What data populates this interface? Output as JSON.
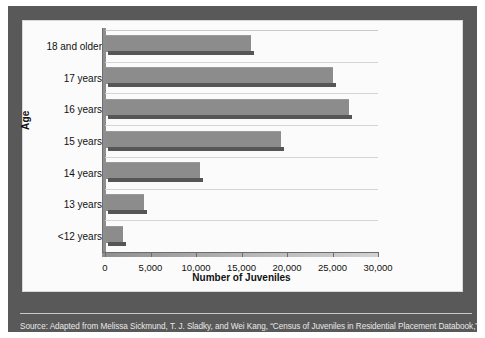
{
  "figure": {
    "source_note": "Source: Adapted from Melissa Sickmund, T. J. Sladky, and Wei Kang, “Census of Juveniles in Residential Placement Databook,”",
    "frame_color": "#595959",
    "plot_background": "#fbfbfb",
    "bar_face_color": "#8c8c8c",
    "bar_shadow_color": "#565656",
    "gridline_color": "#d5d5d5"
  },
  "chart_data": {
    "type": "bar",
    "orientation": "horizontal",
    "title": "",
    "xlabel": "Number of Juveniles",
    "ylabel": "Age",
    "categories": [
      "18 and older",
      "17 years",
      "16 years",
      "15 years",
      "14 years",
      "13 years",
      "<12 years"
    ],
    "values": [
      16000,
      25000,
      26800,
      19300,
      10400,
      4300,
      2000
    ],
    "xlim": [
      0,
      30000
    ],
    "xticks": [
      0,
      5000,
      10000,
      15000,
      20000,
      25000,
      30000
    ],
    "xtick_labels": [
      "0",
      "5,000",
      "10,000",
      "15,000",
      "20,000",
      "25,000",
      "30,000"
    ],
    "grid": true,
    "grid_axis": "y",
    "legend": false,
    "legend_position": "none"
  }
}
